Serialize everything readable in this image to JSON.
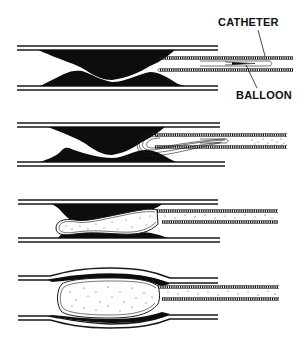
{
  "diagram": {
    "type": "medical-illustration",
    "labels": {
      "catheter": "CATHETER",
      "balloon": "BALLOON"
    },
    "panels": [
      {
        "step": 1,
        "description": "Catheter with deflated balloon positioned near narrowed artery with plaque"
      },
      {
        "step": 2,
        "description": "Deflated balloon advanced into the stenosis"
      },
      {
        "step": 3,
        "description": "Balloon inflating within plaque-narrowed segment"
      },
      {
        "step": 4,
        "description": "Fully inflated balloon compresses plaque and widens artery"
      }
    ],
    "colors": {
      "ink": "#111111",
      "background": "#ffffff"
    }
  }
}
